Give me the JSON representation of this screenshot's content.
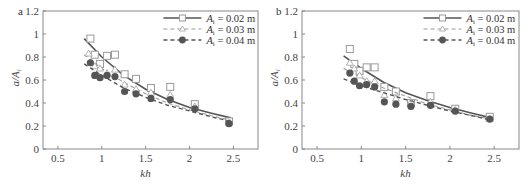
{
  "chart_data": [
    {
      "panel": "a",
      "type": "scatter",
      "xlabel": "kh",
      "ylabel": "a/A_i",
      "xlim": [
        0.33,
        2.78
      ],
      "ylim": [
        0,
        1.2
      ],
      "xticks": [
        "0.5",
        "1",
        "1.5",
        "2",
        "2.5"
      ],
      "yticks": [
        "0",
        "0.2",
        "0.4",
        "0.6",
        "0.8",
        "1",
        "1.2"
      ],
      "grid": false,
      "legend_position": "upper right",
      "series": [
        {
          "name": "A_i = 0.02 m",
          "marker": "open-square",
          "line": "solid",
          "points": [
            [
              0.87,
              0.96
            ],
            [
              0.92,
              0.82
            ],
            [
              0.98,
              0.74
            ],
            [
              1.06,
              0.81
            ],
            [
              1.15,
              0.82
            ],
            [
              1.26,
              0.65
            ],
            [
              1.39,
              0.61
            ],
            [
              1.56,
              0.53
            ],
            [
              1.78,
              0.54
            ],
            [
              2.06,
              0.39
            ],
            [
              2.45,
              0.24
            ]
          ],
          "fit": [
            [
              0.8,
              0.96
            ],
            [
              1.0,
              0.8
            ],
            [
              1.25,
              0.64
            ],
            [
              1.5,
              0.52
            ],
            [
              1.75,
              0.43
            ],
            [
              2.0,
              0.36
            ],
            [
              2.25,
              0.31
            ],
            [
              2.47,
              0.27
            ]
          ]
        },
        {
          "name": "A_i = 0.03 m",
          "marker": "open-triangle",
          "line": "dashed",
          "points": [
            [
              0.85,
              0.83
            ],
            [
              0.92,
              0.72
            ],
            [
              0.98,
              0.7
            ],
            [
              1.06,
              0.66
            ],
            [
              1.15,
              0.69
            ],
            [
              1.26,
              0.56
            ],
            [
              1.39,
              0.52
            ],
            [
              1.56,
              0.49
            ],
            [
              1.78,
              0.47
            ],
            [
              2.06,
              0.37
            ],
            [
              2.45,
              0.23
            ]
          ],
          "fit": [
            [
              0.8,
              0.82
            ],
            [
              1.0,
              0.7
            ],
            [
              1.25,
              0.58
            ],
            [
              1.5,
              0.48
            ],
            [
              1.75,
              0.4
            ],
            [
              2.0,
              0.34
            ],
            [
              2.25,
              0.29
            ],
            [
              2.47,
              0.25
            ]
          ]
        },
        {
          "name": "A_i = 0.04 m",
          "marker": "filled-circle",
          "line": "dashed",
          "points": [
            [
              0.87,
              0.75
            ],
            [
              0.92,
              0.64
            ],
            [
              0.98,
              0.62
            ],
            [
              1.06,
              0.64
            ],
            [
              1.15,
              0.63
            ],
            [
              1.26,
              0.5
            ],
            [
              1.39,
              0.48
            ],
            [
              1.56,
              0.44
            ],
            [
              1.78,
              0.43
            ],
            [
              2.06,
              0.35
            ],
            [
              2.45,
              0.22
            ]
          ],
          "fit": [
            [
              0.8,
              0.74
            ],
            [
              1.0,
              0.64
            ],
            [
              1.25,
              0.53
            ],
            [
              1.5,
              0.45
            ],
            [
              1.75,
              0.38
            ],
            [
              2.0,
              0.33
            ],
            [
              2.25,
              0.28
            ],
            [
              2.47,
              0.24
            ]
          ]
        }
      ]
    },
    {
      "panel": "b",
      "type": "scatter",
      "xlabel": "kh",
      "ylabel": "a/A_i",
      "xlim": [
        0.33,
        2.78
      ],
      "ylim": [
        0,
        1.2
      ],
      "xticks": [
        "0.5",
        "1",
        "1.5",
        "2",
        "2.5"
      ],
      "yticks": [
        "0",
        "0.2",
        "0.4",
        "0.6",
        "0.8",
        "1",
        "1.2"
      ],
      "grid": false,
      "legend_position": "upper right",
      "series": [
        {
          "name": "A_i = 0.02 m",
          "marker": "open-square",
          "line": "solid",
          "points": [
            [
              0.87,
              0.87
            ],
            [
              0.92,
              0.74
            ],
            [
              0.98,
              0.68
            ],
            [
              1.06,
              0.71
            ],
            [
              1.15,
              0.71
            ],
            [
              1.26,
              0.54
            ],
            [
              1.39,
              0.5
            ],
            [
              1.56,
              0.4
            ],
            [
              1.78,
              0.46
            ],
            [
              2.06,
              0.35
            ],
            [
              2.45,
              0.28
            ]
          ],
          "fit": [
            [
              0.8,
              0.81
            ],
            [
              1.0,
              0.7
            ],
            [
              1.25,
              0.58
            ],
            [
              1.5,
              0.49
            ],
            [
              1.75,
              0.42
            ],
            [
              2.0,
              0.36
            ],
            [
              2.25,
              0.31
            ],
            [
              2.47,
              0.27
            ]
          ]
        },
        {
          "name": "A_i = 0.03 m",
          "marker": "open-triangle",
          "line": "dashed",
          "points": [
            [
              0.87,
              0.75
            ],
            [
              0.92,
              0.7
            ],
            [
              0.98,
              0.64
            ],
            [
              1.06,
              0.59
            ],
            [
              1.15,
              0.59
            ],
            [
              1.26,
              0.47
            ],
            [
              1.39,
              0.44
            ],
            [
              1.56,
              0.41
            ],
            [
              1.78,
              0.41
            ],
            [
              2.06,
              0.34
            ],
            [
              2.45,
              0.26
            ]
          ],
          "fit": [
            [
              0.8,
              0.7
            ],
            [
              1.0,
              0.62
            ],
            [
              1.25,
              0.53
            ],
            [
              1.5,
              0.46
            ],
            [
              1.75,
              0.39
            ],
            [
              2.0,
              0.34
            ],
            [
              2.25,
              0.29
            ],
            [
              2.47,
              0.26
            ]
          ]
        },
        {
          "name": "A_i = 0.04 m",
          "marker": "filled-circle",
          "line": "dashed",
          "points": [
            [
              0.87,
              0.66
            ],
            [
              0.92,
              0.59
            ],
            [
              0.98,
              0.55
            ],
            [
              1.06,
              0.56
            ],
            [
              1.15,
              0.54
            ],
            [
              1.26,
              0.41
            ],
            [
              1.39,
              0.39
            ],
            [
              1.56,
              0.37
            ],
            [
              1.78,
              0.38
            ],
            [
              2.06,
              0.33
            ],
            [
              2.45,
              0.26
            ]
          ],
          "fit": [
            [
              0.8,
              0.61
            ],
            [
              1.0,
              0.55
            ],
            [
              1.25,
              0.49
            ],
            [
              1.5,
              0.43
            ],
            [
              1.75,
              0.38
            ],
            [
              2.0,
              0.33
            ],
            [
              2.25,
              0.29
            ],
            [
              2.47,
              0.25
            ]
          ]
        }
      ]
    }
  ],
  "panels": {
    "a": {
      "label": "a"
    },
    "b": {
      "label": "b"
    }
  },
  "axis": {
    "xlabel": "kh",
    "ylabel_main": "a",
    "ylabel_sep": "/",
    "ylabel_sym": "A",
    "ylabel_sub": "i"
  },
  "legend": [
    {
      "sym": "A",
      "sub": "i",
      "value": " = 0.02 m"
    },
    {
      "sym": "A",
      "sub": "i",
      "value": " = 0.03 m"
    },
    {
      "sym": "A",
      "sub": "i",
      "value": " = 0.04 m"
    }
  ],
  "colors": {
    "axis": "#888888",
    "line": "#555555",
    "marker_fill": "#555555",
    "open_marker": "#999999"
  }
}
